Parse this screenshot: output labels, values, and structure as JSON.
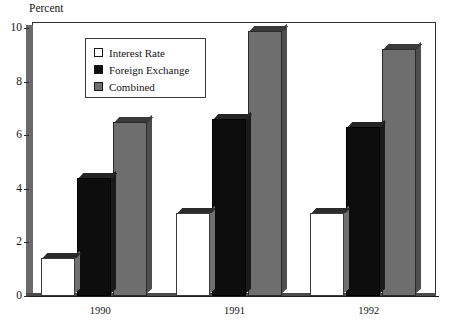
{
  "chart_data": {
    "type": "bar",
    "title": "",
    "subtitle": "",
    "xlabel": "",
    "ylabel": "Percent",
    "categories": [
      "1990",
      "1991",
      "1992"
    ],
    "ylim": [
      0,
      10
    ],
    "y_ticks": [
      "0",
      "2",
      "4",
      "6",
      "8",
      "10"
    ],
    "y_tick_values": [
      0,
      2,
      4,
      6,
      8,
      10
    ],
    "grid": false,
    "legend_position": "top-left-inside",
    "series": [
      {
        "name": "Interest Rate",
        "color": "#ffffff",
        "values": [
          1.4,
          3.1,
          3.1
        ]
      },
      {
        "name": "Foreign Exchange",
        "color": "#0d0d0d",
        "values": [
          4.4,
          6.6,
          6.3
        ]
      },
      {
        "name": "Combined",
        "color": "#6e6e6e",
        "values": [
          6.5,
          9.9,
          9.2
        ]
      }
    ]
  },
  "axis": {
    "y_title": "Percent"
  },
  "legend": {
    "items": [
      {
        "label": "Interest Rate"
      },
      {
        "label": "Foreign Exchange"
      },
      {
        "label": "Combined"
      }
    ]
  }
}
